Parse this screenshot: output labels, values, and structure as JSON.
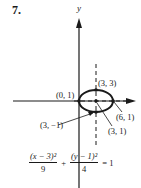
{
  "problem": {
    "number": "7."
  },
  "graph": {
    "y_axis_label": "y",
    "ellipse": {
      "center": [
        3,
        1
      ],
      "a": 3,
      "b": 2
    },
    "points": [
      {
        "label": "(3, 3)",
        "coords": [
          3,
          3
        ]
      },
      {
        "label": "(0, 1)",
        "coords": [
          0,
          1
        ]
      },
      {
        "label": "(6, 1)",
        "coords": [
          6,
          1
        ]
      },
      {
        "label": "(3, −1)",
        "coords": [
          3,
          -1
        ]
      },
      {
        "label": "(3, 1)",
        "coords": [
          3,
          1
        ]
      }
    ]
  },
  "equation": {
    "term1_num": "(x − 3)²",
    "term1_den": "9",
    "plus": "+",
    "term2_num": "(y − 1)²",
    "term2_den": "4",
    "equals": "= 1"
  }
}
